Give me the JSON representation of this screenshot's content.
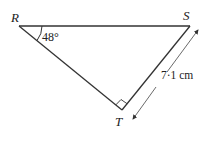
{
  "diagram": {
    "type": "right-triangle",
    "vertices": {
      "R": {
        "label": "R"
      },
      "S": {
        "label": "S"
      },
      "T": {
        "label": "T"
      }
    },
    "angle_R": {
      "label": "48°",
      "value": 48
    },
    "right_angle_at": "T",
    "side_TS": {
      "label": "7·1 cm",
      "value": 7.1,
      "unit": "cm"
    }
  }
}
